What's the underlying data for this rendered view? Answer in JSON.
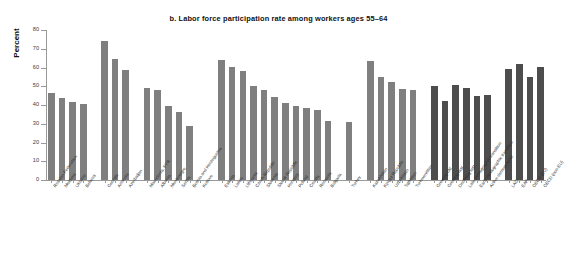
{
  "chart": {
    "title": "b. Labor force participation rate among workers ages 55–64",
    "ylabel": "Percent"
  },
  "colors": {
    "light_gray": "#7f7f7f",
    "dark_gray": "#4d4d4d",
    "axis": "#9a9a9a",
    "text": "#2e2e2e",
    "background": "#ffffff"
  },
  "chart_data": {
    "type": "bar",
    "title": "b. Labor force participation rate among workers ages 55–64",
    "xlabel": "",
    "ylabel": "Percent",
    "ylim": [
      0,
      80
    ],
    "yticks": [
      0,
      10,
      20,
      30,
      40,
      50,
      60,
      70,
      80
    ],
    "grid": false,
    "legend": "none",
    "series_note": "Light gray bars = ECA countries; dark gray bars = regional aggregates / comparators",
    "categories": [
      "Russian Federation",
      "Moldova",
      "Ukraine",
      "Belarus",
      "Georgia",
      "Armenia",
      "Azerbaijan",
      "Macedonia, FYR",
      "Albania",
      "Montenegro",
      "Serbia",
      "Bosnia and Herzegovina",
      "Kosovo",
      "Estonia",
      "Latvia",
      "Lithuania",
      "Czech Republic",
      "Slovenia",
      "Slovak Republic",
      "Hungary",
      "Poland",
      "Croatia",
      "Romania",
      "Bulgaria",
      "Turkey",
      "Kazakhstan",
      "Kyrgyz Republic",
      "Uzbekistan",
      "Tajikistan",
      "Turkmenistan",
      "Growing old",
      "Growing fast",
      "Declining fast",
      "Late demographic transition",
      "Early demographic transition",
      "Active demographic",
      "LAC",
      "EAP",
      "OECD (EU)",
      "OECD (non-EU)"
    ],
    "values": [
      46.4,
      43.5,
      41.8,
      40.6,
      74.2,
      64.6,
      58.8,
      48.9,
      48.1,
      39.6,
      36.5,
      28.8,
      0,
      63.9,
      60.1,
      58.2,
      50.1,
      48.2,
      44.4,
      40.9,
      39.6,
      38.5,
      37.4,
      31.5,
      31.1,
      63.7,
      55.2,
      52.2,
      48.8,
      47.8,
      50.1,
      42.3,
      50.6,
      49.2,
      44.6,
      45.1,
      59.3,
      61.7,
      55.2,
      60.2
    ],
    "groups": [
      {
        "name": "Eastern Partnership / Russia",
        "indices": [
          0,
          1,
          2,
          3
        ],
        "color": "light_gray"
      },
      {
        "name": "Caucasus",
        "indices": [
          4,
          5,
          6
        ],
        "color": "light_gray"
      },
      {
        "name": "Western Balkans",
        "indices": [
          7,
          8,
          9,
          10,
          11,
          12
        ],
        "color": "light_gray"
      },
      {
        "name": "EU new member states",
        "indices": [
          13,
          14,
          15,
          16,
          17,
          18,
          19,
          20,
          21,
          22,
          23
        ],
        "color": "light_gray"
      },
      {
        "name": "Turkey",
        "indices": [
          24
        ],
        "color": "light_gray"
      },
      {
        "name": "Central Asia",
        "indices": [
          25,
          26,
          27,
          28,
          29
        ],
        "color": "light_gray"
      },
      {
        "name": "Demographic typologies",
        "indices": [
          30,
          31,
          32,
          33,
          34,
          35
        ],
        "color": "dark_gray"
      },
      {
        "name": "Comparator regions",
        "indices": [
          36,
          37,
          38,
          39
        ],
        "color": "dark_gray"
      }
    ]
  }
}
